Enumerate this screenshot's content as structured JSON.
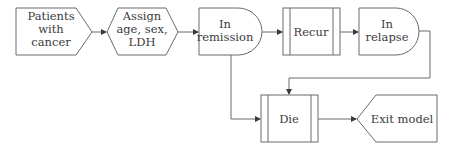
{
  "diagram": {
    "type": "flowchart",
    "nodes": [
      {
        "id": "patients",
        "shape": "pentagon-right",
        "lines": [
          "Patients",
          "with",
          "cancer"
        ]
      },
      {
        "id": "assign",
        "shape": "hexagon",
        "lines": [
          "Assign",
          "age, sex,",
          "LDH"
        ]
      },
      {
        "id": "remission",
        "shape": "delay",
        "lines": [
          "In",
          "remission"
        ]
      },
      {
        "id": "recur",
        "shape": "predefined-process",
        "lines": [
          "Recur"
        ]
      },
      {
        "id": "relapse",
        "shape": "delay",
        "lines": [
          "In",
          "relapse"
        ]
      },
      {
        "id": "die",
        "shape": "predefined-process",
        "lines": [
          "Die"
        ]
      },
      {
        "id": "exit",
        "shape": "pentagon-left",
        "lines": [
          "Exit model"
        ]
      }
    ],
    "edges": [
      {
        "from": "patients",
        "to": "assign"
      },
      {
        "from": "assign",
        "to": "remission"
      },
      {
        "from": "remission",
        "to": "recur"
      },
      {
        "from": "recur",
        "to": "relapse"
      },
      {
        "from": "relapse",
        "to": "die"
      },
      {
        "from": "remission",
        "to": "die"
      },
      {
        "from": "die",
        "to": "exit"
      }
    ]
  }
}
